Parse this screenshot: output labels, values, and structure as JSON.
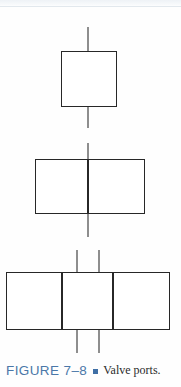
{
  "page": {
    "background_color": "#fefefe",
    "width": 181,
    "height": 387
  },
  "figure": {
    "name": "valve-ports-diagram",
    "line_color": "#272727",
    "port_line_color": "#8e8e8e",
    "diagrams": [
      {
        "id": "two-way-valve",
        "label": "two-port valve body",
        "cells": 1,
        "box": {
          "x": 61,
          "y": 51,
          "width": 56,
          "height": 56
        },
        "port_lines": [
          {
            "x": 88,
            "y1": 27,
            "y2": 51,
            "side": "top"
          },
          {
            "x": 88,
            "y1": 107,
            "y2": 128,
            "side": "bottom"
          }
        ]
      },
      {
        "id": "three-way-valve",
        "label": "two-position valve body",
        "cells": 2,
        "box": {
          "x": 35,
          "y": 159,
          "width": 110,
          "height": 55
        },
        "dividers": [
          88
        ],
        "port_lines": [
          {
            "x": 88,
            "y1": 143,
            "y2": 159,
            "side": "top"
          },
          {
            "x": 88,
            "y1": 214,
            "y2": 237,
            "side": "bottom"
          }
        ]
      },
      {
        "id": "four-way-valve",
        "label": "three-position valve body",
        "cells": 3,
        "box": {
          "x": 6,
          "y": 272,
          "width": 164,
          "height": 58
        },
        "dividers": [
          62,
          113
        ],
        "port_lines": [
          {
            "x": 77,
            "y1": 250,
            "y2": 272,
            "side": "top"
          },
          {
            "x": 99,
            "y1": 250,
            "y2": 272,
            "side": "top"
          },
          {
            "x": 77,
            "y1": 330,
            "y2": 353,
            "side": "bottom"
          },
          {
            "x": 99,
            "y1": 330,
            "y2": 353,
            "side": "bottom"
          }
        ]
      }
    ]
  },
  "caption": {
    "number": "FIGURE 7–8",
    "bullet": "square-bullet",
    "text": "Valve ports.",
    "number_color": "#4a77a8",
    "bullet_color": "#3f6fa5",
    "text_color": "#2b2b2b"
  }
}
